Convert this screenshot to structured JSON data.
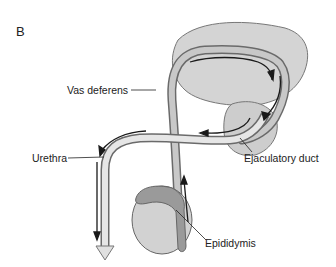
{
  "figure": {
    "panel_letter": "B",
    "labels": {
      "vas_deferens": "Vas deferens",
      "urethra": "Urethra",
      "ejaculatory_duct": "Ejaculatory duct",
      "epididymis": "Epididymis"
    },
    "colors": {
      "organ_fill": "#d4d4d4",
      "organ_stroke": "#777777",
      "duct_fill": "#c8c8c8",
      "duct_stroke": "#6a6a6a",
      "epididymis_fill": "#9a9a9a",
      "arrow": "#1a1a1a",
      "text": "#222222"
    }
  }
}
